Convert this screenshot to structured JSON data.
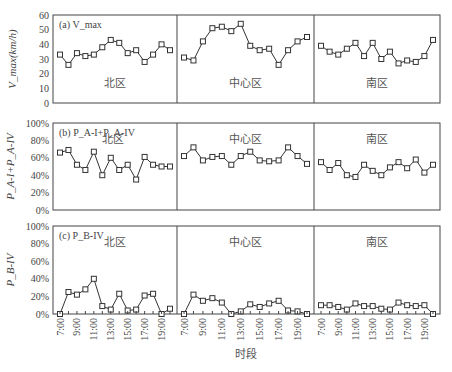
{
  "chart_data": [
    {
      "type": "line",
      "panel": "(a)",
      "title": "(a) V_max",
      "ylabel": "V_max(km/h)",
      "ylim": [
        0,
        60
      ],
      "yticks": [
        "0",
        "10",
        "20",
        "30",
        "40",
        "50",
        "60"
      ],
      "groups": [
        {
          "name": "北区",
          "values": [
            33,
            26,
            34,
            32,
            33,
            38,
            43,
            41,
            34,
            36,
            28,
            33,
            40,
            36
          ]
        },
        {
          "name": "中心区",
          "values": [
            31,
            29,
            42,
            51,
            52,
            49,
            54,
            39,
            36,
            37,
            26,
            36,
            42,
            45
          ]
        },
        {
          "name": "南区",
          "values": [
            39,
            35,
            33,
            37,
            41,
            32,
            41,
            30,
            35,
            27,
            29,
            28,
            32,
            43
          ]
        }
      ]
    },
    {
      "type": "line",
      "panel": "(b)",
      "title": "(b) P_A-I+P_A-IV",
      "ylabel": "P_A-I+P_A-IV",
      "ylim": [
        0,
        100
      ],
      "yticks": [
        "0%",
        "20%",
        "40%",
        "60%",
        "80%",
        "100%"
      ],
      "groups": [
        {
          "name": "北区",
          "values": [
            66,
            69,
            52,
            46,
            67,
            40,
            60,
            46,
            52,
            35,
            61,
            52,
            50,
            50
          ]
        },
        {
          "name": "中心区",
          "values": [
            62,
            72,
            57,
            61,
            62,
            52,
            62,
            67,
            57,
            56,
            57,
            72,
            62,
            53
          ]
        },
        {
          "name": "南区",
          "values": [
            55,
            46,
            54,
            40,
            38,
            52,
            45,
            40,
            49,
            55,
            48,
            58,
            43,
            52
          ]
        }
      ]
    },
    {
      "type": "line",
      "panel": "(c)",
      "title": "(c) P_B-IV",
      "ylabel": "P_B-IV",
      "ylim": [
        0,
        100
      ],
      "yticks": [
        "0%",
        "20%",
        "40%",
        "60%",
        "80%",
        "100%"
      ],
      "groups": [
        {
          "name": "北区",
          "values": [
            0,
            25,
            22,
            28,
            40,
            9,
            5,
            23,
            4,
            5,
            21,
            23,
            0,
            6
          ]
        },
        {
          "name": "中心区",
          "values": [
            0,
            22,
            15,
            18,
            13,
            0,
            3,
            11,
            8,
            12,
            15,
            4,
            3,
            0
          ]
        },
        {
          "name": "南区",
          "values": [
            10,
            10,
            8,
            5,
            12,
            9,
            9,
            6,
            5,
            13,
            10,
            9,
            10,
            0
          ]
        }
      ]
    }
  ],
  "x_tick_labels": [
    "7:00",
    "9:00",
    "11:00",
    "13:00",
    "15:00",
    "17:00",
    "19:00"
  ],
  "xlabel": "时段",
  "grid": false,
  "marker": "open-square"
}
